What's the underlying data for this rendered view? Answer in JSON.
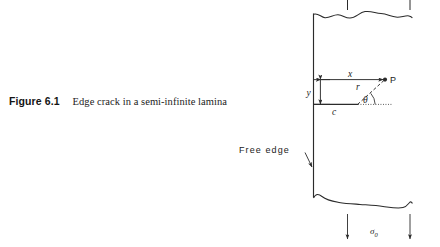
{
  "figure": {
    "number_label": "Figure 6.1",
    "caption_text": "Edge crack in a semi-infinite lamina"
  },
  "diagram": {
    "labels": {
      "point_p": "P",
      "distance_x": "x",
      "distance_y": "y",
      "radius_r": "r",
      "angle_theta": "θ",
      "crack_length_c": "c",
      "free_edge": "Free edge",
      "stress_sigma": "σ",
      "stress_subscript": "0"
    },
    "colors": {
      "line": "#2b2b2b",
      "text": "#1b1b1b",
      "background": "#ffffff"
    }
  }
}
